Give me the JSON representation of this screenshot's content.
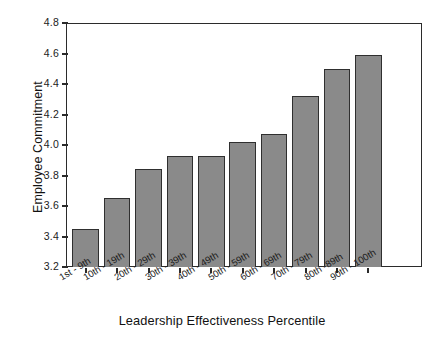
{
  "chart_data": {
    "type": "bar",
    "title": "",
    "xlabel": "Leadership Effectiveness Percentile",
    "ylabel": "Employee Commitment",
    "categories": [
      "1st - 9th",
      "10th - 19th",
      "20th - 29th",
      "30th - 39th",
      "40th - 49th",
      "50th - 59th",
      "60th - 69th",
      "70th - 79th",
      "80th -89th",
      "90th - 100th"
    ],
    "values": [
      3.45,
      3.65,
      3.84,
      3.93,
      3.93,
      4.02,
      4.07,
      4.32,
      4.5,
      4.59
    ],
    "ylim": [
      3.2,
      4.8
    ],
    "ytick_labels": [
      "4.8",
      "4.6",
      "4.4",
      "4.2",
      "4.0",
      "3.8",
      "3.6",
      "3.4",
      "3.2"
    ],
    "ytick_values": [
      4.8,
      4.6,
      4.4,
      4.2,
      4.0,
      3.8,
      3.6,
      3.4,
      3.2
    ],
    "grid": false,
    "legend": false,
    "legend_position": "none",
    "bar_color": "#8a8a8a",
    "bar_edge_color": "#2f2f2f",
    "axis_color": "#2b2b2b",
    "background_color": "#ffffff"
  }
}
